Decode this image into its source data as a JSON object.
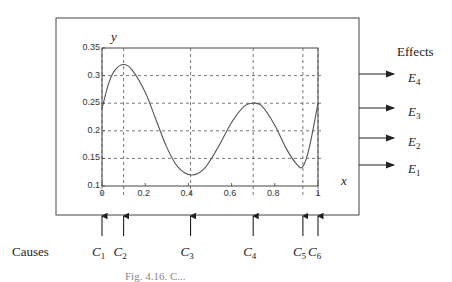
{
  "diagram": {
    "effects_label": "Effects",
    "causes_label": "Causes",
    "caption": "Fig. 4.16. C...",
    "effects": [
      {
        "letter": "E",
        "sub": "4",
        "y": 74
      },
      {
        "letter": "E",
        "sub": "3",
        "y": 108
      },
      {
        "letter": "E",
        "sub": "2",
        "y": 138
      },
      {
        "letter": "E",
        "sub": "1",
        "y": 165
      }
    ],
    "causes": [
      {
        "letter": "C",
        "sub": "1",
        "x": 0.0
      },
      {
        "letter": "C",
        "sub": "2",
        "x": 0.1
      },
      {
        "letter": "C",
        "sub": "3",
        "x": 0.41
      },
      {
        "letter": "C",
        "sub": "4",
        "x": 0.7
      },
      {
        "letter": "C",
        "sub": "5",
        "x": 0.93
      },
      {
        "letter": "C",
        "sub": "6",
        "x": 1.0
      }
    ]
  },
  "chart_data": {
    "type": "line",
    "title": "",
    "xlabel": "x",
    "ylabel": "y",
    "xlim": [
      0,
      1
    ],
    "ylim": [
      0.1,
      0.35
    ],
    "x_ticks": [
      "0",
      "0.2",
      "0.4",
      "0.6",
      "0.8",
      "1"
    ],
    "y_ticks": [
      "0.1",
      "0.15",
      "0.2",
      "0.25",
      "0.3",
      "0.35"
    ],
    "grid": "dashed reference lines at cause x-positions and effect y-levels",
    "h_ref_lines": [
      0.15,
      0.2,
      0.25,
      0.3
    ],
    "v_ref_lines": [
      0.0,
      0.1,
      0.41,
      0.7,
      0.93,
      1.0
    ],
    "series": [
      {
        "name": "y(x)",
        "x": [
          0.0,
          0.03,
          0.06,
          0.1,
          0.14,
          0.2,
          0.25,
          0.3,
          0.35,
          0.41,
          0.47,
          0.53,
          0.6,
          0.66,
          0.7,
          0.74,
          0.8,
          0.85,
          0.9,
          0.93,
          0.96,
          1.0
        ],
        "y": [
          0.24,
          0.285,
          0.31,
          0.32,
          0.31,
          0.27,
          0.22,
          0.17,
          0.135,
          0.12,
          0.13,
          0.165,
          0.215,
          0.245,
          0.25,
          0.245,
          0.21,
          0.17,
          0.14,
          0.135,
          0.17,
          0.25
        ]
      }
    ]
  }
}
